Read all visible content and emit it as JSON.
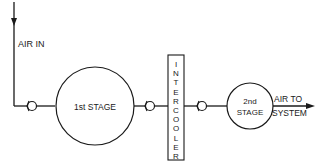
{
  "diagram": {
    "colors": {
      "line": "#1a1a1a",
      "background": "#ffffff"
    },
    "input": {
      "label": "AIR IN",
      "icon": "down-arrow-icon"
    },
    "stages": [
      {
        "id": "stage1",
        "label": "1st STAGE"
      },
      {
        "id": "stage2",
        "label_line1": "2nd",
        "label_line2": "STAGE"
      }
    ],
    "intercooler": {
      "label": "INTERCOOLER",
      "letters": [
        "I",
        "N",
        "T",
        "E",
        "R",
        "C",
        "O",
        "O",
        "L",
        "E",
        "R"
      ]
    },
    "valves": [
      {
        "id": "valve-inlet",
        "icon": "check-valve-icon"
      },
      {
        "id": "valve-between-stage1-intercooler",
        "icon": "check-valve-icon"
      },
      {
        "id": "valve-between-intercooler-stage2",
        "icon": "check-valve-icon"
      }
    ],
    "output": {
      "label_line1": "AIR TO",
      "label_line2": "SYSTEM",
      "icon": "right-arrow-icon"
    }
  }
}
